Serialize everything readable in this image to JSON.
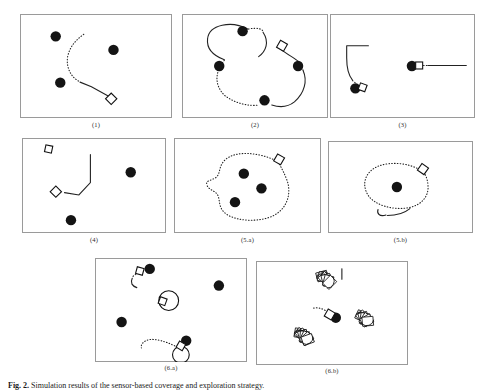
{
  "figure": {
    "caption_prefix": "Fig. 2.",
    "caption_text": "Simulation results of the sensor-based coverage and exploration strategy.",
    "panels": [
      {
        "id": "panel-1",
        "label": "(1)",
        "discs": [
          [
            0.235,
            0.215
          ],
          [
            0.615,
            0.345
          ],
          [
            0.265,
            0.66
          ]
        ],
        "robot": {
          "x": 0.6,
          "y": 0.815,
          "angle": 45
        },
        "solid_path": "M 0.595 0.80 L 0.47 0.70 L 0.395 0.655",
        "dotted_path": "M 0.385 0.645 C 0.33 0.60 0.30 0.50 0.315 0.40 C 0.33 0.31 0.37 0.245 0.42 0.195"
      },
      {
        "id": "panel-2",
        "label": "(2)",
        "discs": [
          [
            0.415,
            0.165
          ],
          [
            0.255,
            0.5
          ],
          [
            0.565,
            0.83
          ],
          [
            0.795,
            0.5
          ]
        ],
        "robot": {
          "x": 0.685,
          "y": 0.305,
          "angle": 30
        },
        "solid_path": "M 0.45 0.145 C 0.34 0.06 0.185 0.10 0.175 0.24 C 0.168 0.33 0.215 0.40 0.29 0.44 M 0.555 0.175 C 0.60 0.27 0.575 0.36 0.525 0.41 M 0.665 0.325 C 0.72 0.39 0.78 0.43 0.80 0.46 M 0.83 0.545 C 0.86 0.64 0.84 0.76 0.77 0.845 C 0.73 0.89 0.67 0.90 0.615 0.875",
        "dotted_path": "M 0.455 0.145 C 0.52 0.125 0.56 0.15 0.555 0.175 M 0.29 0.445 C 0.225 0.56 0.22 0.68 0.29 0.78 C 0.36 0.86 0.46 0.89 0.525 0.875 M 0.80 0.465 C 0.815 0.50 0.825 0.52 0.83 0.545"
      },
      {
        "id": "panel-3",
        "label": "(3)",
        "discs": [
          [
            0.175,
            0.715
          ],
          [
            0.565,
            0.5
          ]
        ],
        "robots": [
          {
            "x": 0.225,
            "y": 0.705,
            "angle": 20,
            "style": "square"
          },
          {
            "x": 0.615,
            "y": 0.495,
            "angle": 0,
            "style": "square"
          }
        ],
        "solid_path": "M 0.115 0.305 L 0.115 0.42 C 0.115 0.52 0.125 0.585 0.155 0.635 M 0.115 0.305 L 0.265 0.305 M 0.675 0.495 L 0.94 0.495",
        "dotted_path": "M 0.155 0.64 L 0.195 0.685 M 0.645 0.495 L 0.715 0.495"
      },
      {
        "id": "panel-4",
        "label": "(4)",
        "discs": [
          [
            0.755,
            0.36
          ],
          [
            0.34,
            0.865
          ]
        ],
        "robots": [
          {
            "x": 0.185,
            "y": 0.115,
            "angle": 12,
            "style": "square"
          },
          {
            "x": 0.235,
            "y": 0.565,
            "angle": 45,
            "style": "diamond"
          }
        ],
        "solid_path": "M 0.295 0.575 L 0.395 0.60 L 0.475 0.47 L 0.475 0.175",
        "dotted_path": ""
      },
      {
        "id": "panel-5a",
        "label": "(5.a)",
        "discs": [
          [
            0.475,
            0.375
          ],
          [
            0.595,
            0.53
          ],
          [
            0.415,
            0.675
          ]
        ],
        "robot": {
          "x": 0.715,
          "y": 0.225,
          "angle": 30
        },
        "solid_path": "",
        "dotted_path": "M 0.69 0.235 C 0.58 0.155 0.43 0.13 0.355 0.22 C 0.30 0.29 0.32 0.36 0.29 0.41 C 0.255 0.455 0.21 0.44 0.225 0.50 C 0.24 0.555 0.285 0.55 0.30 0.61 C 0.315 0.67 0.30 0.74 0.36 0.805 C 0.44 0.885 0.60 0.885 0.685 0.81 C 0.78 0.725 0.80 0.56 0.765 0.43 C 0.74 0.33 0.715 0.275 0.705 0.24"
      },
      {
        "id": "panel-5b",
        "label": "(5.b)",
        "discs": [
          [
            0.475,
            0.5
          ]
        ],
        "robot": {
          "x": 0.655,
          "y": 0.305,
          "angle": 35
        },
        "solid_path": "M 0.40 0.805 C 0.355 0.825 0.335 0.79 0.345 0.745 M 0.41 0.81 C 0.47 0.81 0.53 0.78 0.565 0.735",
        "dotted_path": "M 0.63 0.31 C 0.555 0.24 0.43 0.22 0.345 0.275 C 0.255 0.335 0.23 0.47 0.275 0.585 C 0.32 0.70 0.45 0.755 0.555 0.725 C 0.645 0.70 0.695 0.60 0.69 0.49 C 0.687 0.41 0.67 0.355 0.655 0.325"
      },
      {
        "id": "panel-6a",
        "label": "(6.a)",
        "discs": [
          [
            0.36,
            0.105
          ],
          [
            0.815,
            0.265
          ],
          [
            0.175,
            0.615
          ],
          [
            0.6,
            0.795
          ]
        ],
        "robots": [
          {
            "x": 0.295,
            "y": 0.125,
            "angle": 15,
            "style": "square"
          },
          {
            "x": 0.565,
            "y": 0.845,
            "angle": 30,
            "style": "square"
          },
          {
            "x": 0.445,
            "y": 0.415,
            "angle": 20,
            "style": "square"
          }
        ],
        "circles": [
          {
            "cx": 0.485,
            "cy": 0.41,
            "r": 0.065
          },
          {
            "cx": 0.565,
            "cy": 0.93,
            "r": 0.055
          }
        ],
        "solid_path": "M 0.245 0.195 C 0.23 0.24 0.245 0.27 0.275 0.285",
        "dotted_path": "M 0.285 0.145 C 0.255 0.165 0.245 0.18 0.245 0.195 M 0.525 0.845 C 0.46 0.80 0.40 0.775 0.355 0.785 C 0.315 0.80 0.30 0.835 0.305 0.865"
      },
      {
        "id": "panel-6b",
        "label": "(6.b)",
        "discs": [
          [
            0.525,
            0.545
          ]
        ],
        "robot": {
          "x": 0.485,
          "y": 0.515,
          "angle": 30
        },
        "clusters": [
          {
            "cx": 0.46,
            "cy": 0.175,
            "n": 6,
            "spread": 0.055,
            "rot": -15
          },
          {
            "cx": 0.715,
            "cy": 0.555,
            "n": 7,
            "spread": 0.045,
            "rot": 25
          },
          {
            "cx": 0.315,
            "cy": 0.725,
            "n": 8,
            "spread": 0.055,
            "rot": 10
          }
        ],
        "solid_path": "M 0.565 0.075 L 0.565 0.175",
        "dotted_path": "M 0.455 0.475 C 0.425 0.45 0.395 0.445 0.375 0.455"
      }
    ]
  }
}
